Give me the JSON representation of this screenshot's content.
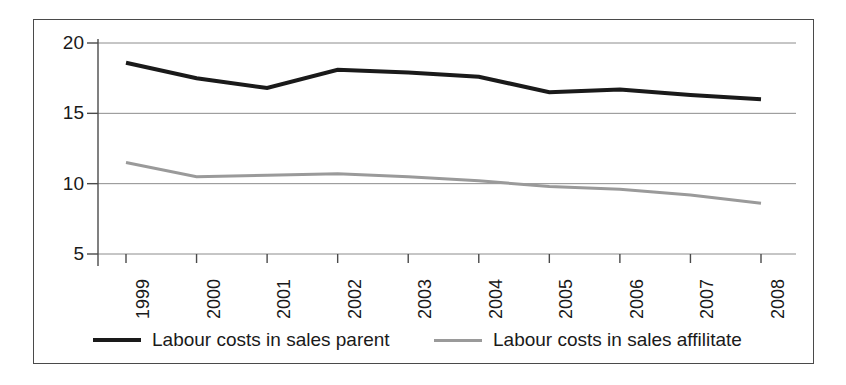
{
  "chart_data": {
    "type": "line",
    "title": "",
    "subtitle": "",
    "xlabel": "",
    "ylabel": "",
    "categories": [
      "1999",
      "2000",
      "2001",
      "2002",
      "2003",
      "2004",
      "2005",
      "2006",
      "2007",
      "2008"
    ],
    "ylim": [
      5,
      20
    ],
    "yticks": [
      5,
      10,
      15,
      20
    ],
    "ytick_labels": [
      "5",
      "10",
      "15",
      "20"
    ],
    "grid": true,
    "grid_axis": "y",
    "legend_position": "bottom",
    "series": [
      {
        "name": "Labour costs in sales parent",
        "color": "#1a1a1a",
        "line_width": 4,
        "values": [
          18.6,
          17.5,
          16.8,
          18.1,
          17.9,
          17.6,
          16.5,
          16.7,
          16.3,
          16.0
        ]
      },
      {
        "name": "Labour costs in sales affilitate",
        "color": "#9a9a9a",
        "line_width": 3,
        "values": [
          11.5,
          10.5,
          10.6,
          10.7,
          10.5,
          10.2,
          9.8,
          9.6,
          9.2,
          8.6
        ]
      }
    ]
  },
  "axes": {
    "y_ticks": [
      {
        "label": "20",
        "value": 20
      },
      {
        "label": "15",
        "value": 15
      },
      {
        "label": "10",
        "value": 10
      },
      {
        "label": "5",
        "value": 5
      }
    ],
    "x_ticks": [
      {
        "label": "1999"
      },
      {
        "label": "2000"
      },
      {
        "label": "2001"
      },
      {
        "label": "2002"
      },
      {
        "label": "2003"
      },
      {
        "label": "2004"
      },
      {
        "label": "2005"
      },
      {
        "label": "2006"
      },
      {
        "label": "2007"
      },
      {
        "label": "2008"
      }
    ]
  },
  "legend": {
    "items": [
      {
        "label": "Labour costs in sales parent",
        "color": "#1a1a1a",
        "style": "dark"
      },
      {
        "label": "Labour costs in sales affilitate",
        "color": "#9a9a9a",
        "style": "grey"
      }
    ]
  },
  "colors": {
    "frame": "#4a4a4a",
    "axis": "#4a4a4a",
    "grid": "#8c8c8c",
    "series_parent": "#1a1a1a",
    "series_affiliate": "#9a9a9a",
    "background": "#ffffff"
  }
}
